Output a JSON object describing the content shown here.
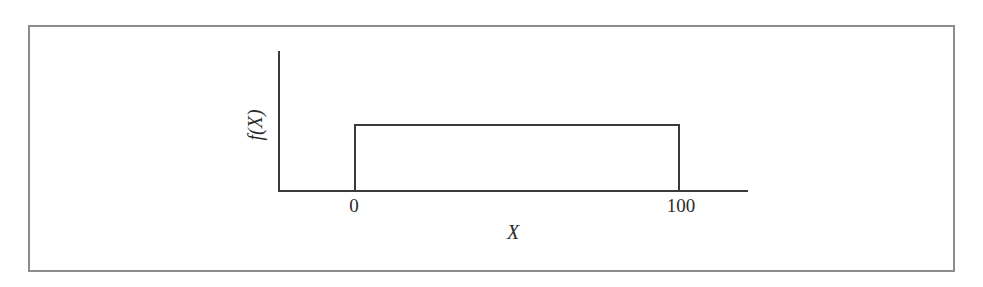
{
  "figure": {
    "frame": {
      "border_color": "#8c8c8c",
      "background_color": "#ffffff"
    },
    "line_color": "#3a3a3a",
    "text_color": "#2b2b2b"
  },
  "chart_data": {
    "type": "line",
    "title": "",
    "subtitle": "",
    "xlabel": "X",
    "ylabel": "f(X)",
    "xtick_labels": [
      "0",
      "100"
    ],
    "xtick_values": [
      0,
      100
    ],
    "ytick_labels": [],
    "xlim": [
      -16,
      100
    ],
    "ylim": [
      0,
      0.0144
    ],
    "grid": false,
    "legend": null,
    "annotations": [],
    "series": [
      {
        "name": "uniform-density",
        "x": [
          0,
          0,
          100,
          100
        ],
        "y": [
          0,
          0.01,
          0.01,
          0
        ]
      }
    ]
  }
}
